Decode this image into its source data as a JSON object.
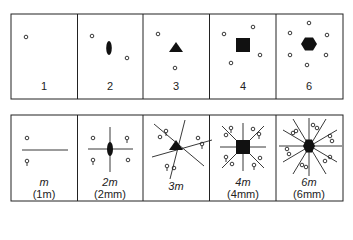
{
  "top_row": {
    "labels": [
      "1",
      "2",
      "3",
      "4",
      "6"
    ],
    "shapes": [
      "none",
      "ellipse",
      "triangle",
      "square",
      "hexagon"
    ]
  },
  "bottom_row": {
    "labels": [
      {
        "main": "m",
        "sub": "(1m)"
      },
      {
        "main": "2m",
        "sub": "(2mm)"
      },
      {
        "main": "3m",
        "sub": ""
      },
      {
        "main": "4m",
        "sub": "(4mm)"
      },
      {
        "main": "6m",
        "sub": "(6mm)"
      }
    ]
  },
  "colors": {
    "ink": "#1a1a1a",
    "background": "#ffffff"
  }
}
